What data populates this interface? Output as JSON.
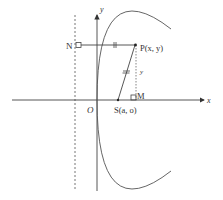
{
  "diagram": {
    "type": "parabola-focus-directrix",
    "labels": {
      "y_axis": "y",
      "x_axis": "x",
      "origin": "O",
      "point_N": "N",
      "point_P": "P(x, y)",
      "point_S": "S(a, o)",
      "point_M": "M",
      "segment_PM": "y"
    },
    "colors": {
      "stroke": "#444444",
      "curve": "#555555",
      "text": "#333333",
      "background": "#ffffff"
    }
  }
}
